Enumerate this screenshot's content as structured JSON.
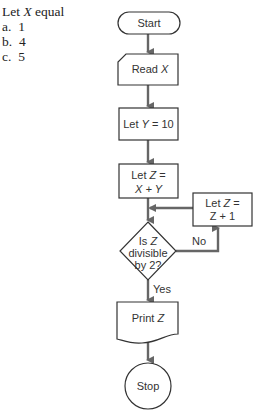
{
  "question": {
    "prompt_pre": "Let ",
    "prompt_var": "X",
    "prompt_post": " equal",
    "options": [
      {
        "letter": "a.",
        "value": "1"
      },
      {
        "letter": "b.",
        "value": "4"
      },
      {
        "letter": "c.",
        "value": "5"
      }
    ]
  },
  "flowchart": {
    "start": "Start",
    "read_pre": "Read ",
    "read_var": "X",
    "assign_y_pre": "Let ",
    "assign_y_var": "Y",
    "assign_y_post": " = 10",
    "assign_z_line1_pre": "Let ",
    "assign_z_line1_var": "Z",
    "assign_z_line1_post": " =",
    "assign_z_line2": "X + Y",
    "decision_line1_pre": "Is ",
    "decision_line1_var": "Z",
    "decision_line2": "divisible",
    "decision_line3": "by 2?",
    "increment_line1_pre": "Let ",
    "increment_line1_var": "Z",
    "increment_line1_post": " =",
    "increment_line2": "Z + 1",
    "no_label": "No",
    "yes_label": "Yes",
    "print_pre": "Print ",
    "print_var": "Z",
    "stop": "Stop"
  }
}
